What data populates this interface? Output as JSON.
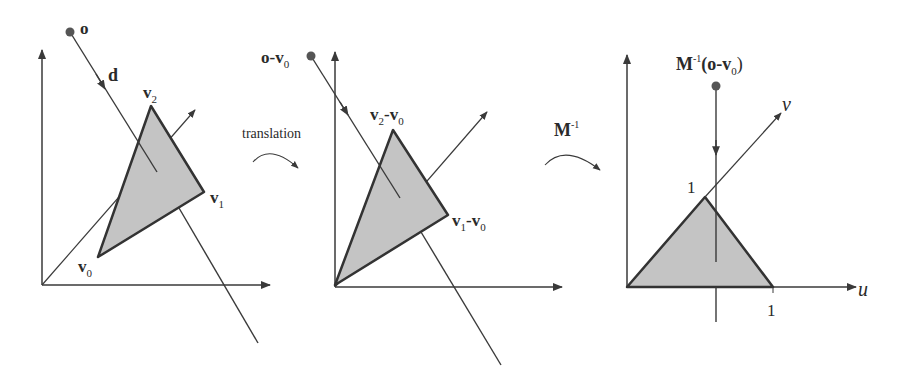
{
  "panels": [
    {
      "id": "original",
      "origin_label": "o",
      "direction_label": "d",
      "vertices": [
        {
          "name": "v",
          "sub": "0"
        },
        {
          "name": "v",
          "sub": "1"
        },
        {
          "name": "v",
          "sub": "2"
        }
      ]
    },
    {
      "id": "translated",
      "origin_label": "o-v",
      "origin_sub": "0",
      "vertex1": {
        "a": "v",
        "a_sub": "1",
        "b": "-v",
        "b_sub": "0"
      },
      "vertex2": {
        "a": "v",
        "a_sub": "2",
        "b": "-v",
        "b_sub": "0"
      }
    },
    {
      "id": "transformed",
      "origin_label_pre": "M",
      "origin_label_sup": "-1",
      "origin_label_post": "(o-v",
      "origin_label_sub": "0",
      "origin_label_close": ")",
      "u_axis": "u",
      "v_axis": "v",
      "tick_u": "1",
      "tick_v": "1"
    }
  ],
  "transitions": [
    {
      "label": "translation"
    },
    {
      "label": "M",
      "sup": "-1"
    }
  ],
  "colors": {
    "line": "#3a3a3a",
    "triangle_fill": "#c4c4c4",
    "triangle_stroke": "#333333",
    "point": "#555555"
  }
}
